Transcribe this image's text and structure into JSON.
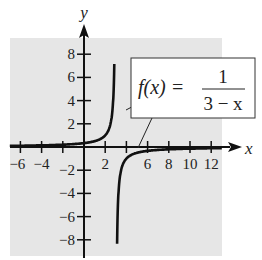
{
  "chart_data": {
    "type": "line",
    "title": "",
    "function_label": "f(x) = 1/(3 − x)",
    "annotation": {
      "lhs": "f(x) =",
      "numerator": "1",
      "denominator": "3 − x"
    },
    "xlabel": "x",
    "ylabel": "y",
    "xlim": [
      -7,
      13
    ],
    "ylim": [
      -9,
      9
    ],
    "x_ticks": [
      -6,
      -4,
      -2,
      2,
      4,
      6,
      8,
      10,
      12
    ],
    "x_tick_labels": [
      "−6",
      "−4",
      "2",
      "6",
      "8",
      "10",
      "12"
    ],
    "y_ticks": [
      8,
      6,
      4,
      2,
      -2,
      -4,
      -6,
      -8
    ],
    "y_tick_labels": [
      "8",
      "6",
      "4",
      "2",
      "−2",
      "−4",
      "−6",
      "−8"
    ],
    "vertical_asymptote": 3,
    "horizontal_asymptote": 0,
    "grid": false,
    "series": [
      {
        "name": "f(x) = 1/(3-x), x<3",
        "x": [
          -7,
          -4,
          -2,
          0,
          1,
          2,
          2.5,
          2.75,
          2.875
        ],
        "y": [
          0.1,
          0.143,
          0.2,
          0.333,
          0.5,
          1,
          2,
          4,
          8
        ]
      },
      {
        "name": "f(x) = 1/(3-x), x>3",
        "x": [
          3.125,
          3.25,
          3.5,
          4,
          5,
          6,
          8,
          10,
          12,
          13
        ],
        "y": [
          -8,
          -4,
          -2,
          -1,
          -0.5,
          -0.333,
          -0.2,
          -0.143,
          -0.111,
          -0.1
        ]
      }
    ],
    "colors": {
      "background_panel": "#e6e6e6",
      "curve": "#111111",
      "axes": "#111111"
    }
  }
}
